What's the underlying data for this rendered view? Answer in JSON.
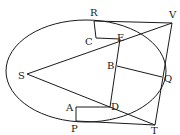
{
  "diagram": {
    "stroke_color": "#1a1a1a",
    "background": "#ffffff",
    "ellipse": {
      "cx": 86,
      "cy": 71,
      "rx": 80,
      "ry": 51
    },
    "points": {
      "R": {
        "label": "R",
        "x": 94,
        "y": 21
      },
      "V": {
        "label": "V",
        "x": 172,
        "y": 23
      },
      "C": {
        "label": "C",
        "x": 96,
        "y": 38
      },
      "E": {
        "label": "E",
        "x": 120,
        "y": 39
      },
      "S": {
        "label": "S",
        "x": 27,
        "y": 74
      },
      "B": {
        "label": "B",
        "x": 117,
        "y": 66
      },
      "Q": {
        "label": "Q",
        "x": 162,
        "y": 77
      },
      "D": {
        "label": "D",
        "x": 110,
        "y": 107
      },
      "A": {
        "label": "A",
        "x": 76,
        "y": 107
      },
      "P": {
        "label": "P",
        "x": 76,
        "y": 121
      },
      "T": {
        "label": "T",
        "x": 155,
        "y": 125
      }
    },
    "labels": [
      "R",
      "V",
      "C",
      "E",
      "S",
      "B",
      "Q",
      "D",
      "A",
      "P",
      "T"
    ]
  }
}
